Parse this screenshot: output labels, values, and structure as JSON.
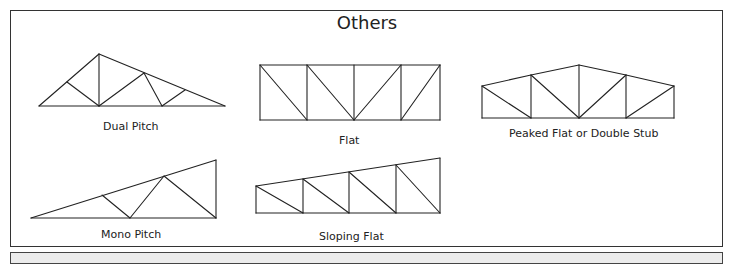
{
  "title": "Others",
  "trusses": [
    {
      "name": "Dual Pitch",
      "label": "Dual Pitch",
      "lines": [
        [
          39,
          106,
          99,
          54
        ],
        [
          99,
          54,
          225,
          106
        ],
        [
          39,
          106,
          225,
          106
        ],
        [
          99,
          54,
          99,
          106
        ],
        [
          67,
          82,
          99,
          106
        ],
        [
          99,
          106,
          144,
          73
        ],
        [
          144,
          73,
          162,
          106
        ],
        [
          162,
          106,
          185,
          90
        ]
      ]
    },
    {
      "name": "Flat",
      "label": "Flat",
      "lines": [
        [
          260,
          65,
          440,
          65
        ],
        [
          260,
          120,
          440,
          120
        ],
        [
          260,
          65,
          260,
          120
        ],
        [
          307,
          65,
          307,
          120
        ],
        [
          354,
          65,
          354,
          120
        ],
        [
          401,
          65,
          401,
          120
        ],
        [
          440,
          65,
          440,
          120
        ],
        [
          260,
          65,
          307,
          120
        ],
        [
          307,
          65,
          354,
          120
        ],
        [
          354,
          120,
          401,
          65
        ],
        [
          401,
          120,
          440,
          65
        ]
      ]
    },
    {
      "name": "Peaked Flat or Double Stub",
      "label": "Peaked Flat or Double Stub",
      "lines": [
        [
          482,
          86,
          531,
          75
        ],
        [
          531,
          75,
          579,
          65
        ],
        [
          579,
          65,
          626,
          75
        ],
        [
          626,
          75,
          674,
          86
        ],
        [
          482,
          118,
          674,
          118
        ],
        [
          482,
          86,
          482,
          118
        ],
        [
          531,
          75,
          531,
          118
        ],
        [
          579,
          65,
          579,
          118
        ],
        [
          626,
          75,
          626,
          118
        ],
        [
          674,
          86,
          674,
          118
        ],
        [
          482,
          86,
          531,
          118
        ],
        [
          531,
          75,
          579,
          118
        ],
        [
          579,
          118,
          626,
          75
        ],
        [
          626,
          118,
          674,
          86
        ]
      ]
    },
    {
      "name": "Mono Pitch",
      "label": "Mono Pitch",
      "lines": [
        [
          31,
          218,
          216,
          160
        ],
        [
          31,
          218,
          216,
          218
        ],
        [
          216,
          160,
          216,
          218
        ],
        [
          102,
          195,
          130,
          218
        ],
        [
          130,
          218,
          164,
          176
        ],
        [
          164,
          176,
          216,
          218
        ]
      ]
    },
    {
      "name": "Sloping Flat",
      "label": "Sloping Flat",
      "lines": [
        [
          256,
          186,
          440,
          158
        ],
        [
          256,
          213,
          440,
          213
        ],
        [
          256,
          186,
          256,
          213
        ],
        [
          303,
          179,
          303,
          213
        ],
        [
          349,
          172,
          349,
          213
        ],
        [
          396,
          165,
          396,
          213
        ],
        [
          440,
          158,
          440,
          213
        ],
        [
          256,
          186,
          303,
          213
        ],
        [
          303,
          179,
          349,
          213
        ],
        [
          349,
          172,
          396,
          213
        ],
        [
          396,
          165,
          440,
          213
        ]
      ]
    }
  ],
  "labels": [
    {
      "text": "Dual Pitch",
      "x": 103,
      "y": 120
    },
    {
      "text": "Flat",
      "x": 339,
      "y": 134
    },
    {
      "text": "Peaked Flat or Double Stub",
      "x": 509,
      "y": 127
    },
    {
      "text": "Mono Pitch",
      "x": 101,
      "y": 228
    },
    {
      "text": "Sloping Flat",
      "x": 319,
      "y": 230
    }
  ],
  "colors": {
    "stroke": "#222222",
    "background": "#ffffff",
    "footer": "#ececec"
  }
}
